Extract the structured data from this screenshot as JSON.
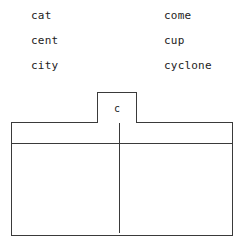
{
  "word_list": {
    "columns": [
      {
        "name": "left-column",
        "words": [
          "cat",
          "cent",
          "city"
        ]
      },
      {
        "name": "right-column",
        "words": [
          "come",
          "cup",
          "cyclone"
        ]
      }
    ]
  },
  "chart": {
    "tab_label": "c",
    "header_cells": [
      "",
      ""
    ],
    "body_cells": [
      "",
      ""
    ]
  },
  "colors": {
    "line": "#3a3a3a",
    "text": "#1c1c1c",
    "background": "#ffffff"
  }
}
